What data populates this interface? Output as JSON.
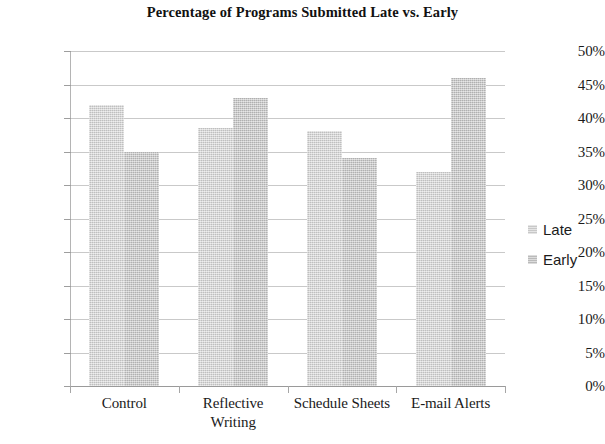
{
  "chart_data": {
    "type": "bar",
    "title": "Percentage of Programs Submitted Late vs. Early",
    "xlabel": "",
    "ylabel": "",
    "categories": [
      "Control",
      "Reflective Writing",
      "Schedule Sheets",
      "E-mail Alerts"
    ],
    "category_lines": [
      [
        "Control"
      ],
      [
        "Reflective",
        "Writing"
      ],
      [
        "Schedule Sheets"
      ],
      [
        "E-mail Alerts"
      ]
    ],
    "series": [
      {
        "name": "Late",
        "values": [
          42,
          38.5,
          38,
          32
        ],
        "color": "#d2d2d2"
      },
      {
        "name": "Early",
        "values": [
          35,
          43,
          34,
          46
        ],
        "color": "#c6c6c6"
      }
    ],
    "ylim": [
      0,
      50
    ],
    "ytick_values": [
      50,
      45,
      40,
      35,
      30,
      25,
      20,
      15,
      10,
      5,
      0
    ],
    "ytick_labels": [
      "50%",
      "45%",
      "40%",
      "35%",
      "30%",
      "25%",
      "20%",
      "15%",
      "10%",
      "5%",
      "0%"
    ],
    "grid": true,
    "legend_position": "right",
    "legend_entries": [
      "Late",
      "Early"
    ],
    "value_unit": "%"
  }
}
